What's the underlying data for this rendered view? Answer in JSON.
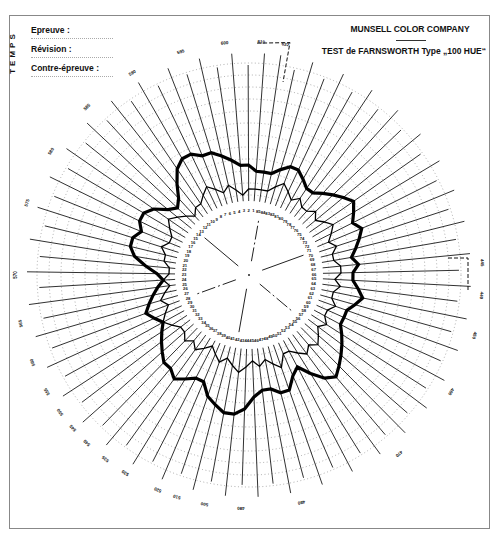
{
  "header": {
    "temps_label": "TEMPS",
    "fields": [
      {
        "label": "Epreuve :"
      },
      {
        "label": "Révision :"
      },
      {
        "label": "Contre-épreuve :"
      }
    ],
    "company": "MUNSELL COLOR COMPANY",
    "test_title": "TEST de FARNSWORTH Type „100 HUE“"
  },
  "chart_data": {
    "type": "radar",
    "title": "TEST de FARNSWORTH Type „100 HUE“",
    "subtitle": "MUNSELL COLOR COMPANY",
    "caps": 85,
    "cap_numbering": "counterclockwise from top, 1 to 85",
    "center": [
      249,
      275
    ],
    "base_radius": 68,
    "unit_px": 6,
    "ring_scores": [
      2,
      4,
      6,
      8,
      10,
      12,
      14,
      16,
      18,
      20,
      22,
      24
    ],
    "inner_ring_labels": [
      "1",
      "2",
      "3",
      "4",
      "5",
      "6",
      "7",
      "8",
      "9",
      "10",
      "11",
      "12",
      "13",
      "14",
      "15",
      "16",
      "17",
      "18",
      "19",
      "20",
      "21",
      "22",
      "23",
      "24",
      "25",
      "26",
      "27",
      "28",
      "29",
      "30",
      "31",
      "32",
      "33",
      "34",
      "35",
      "36",
      "37",
      "38",
      "39",
      "40",
      "41",
      "42",
      "43",
      "44",
      "45",
      "46",
      "47",
      "48",
      "49",
      "50",
      "51",
      "52",
      "53",
      "54",
      "55",
      "56",
      "57",
      "58",
      "59",
      "60",
      "61",
      "62",
      "63",
      "64",
      "65",
      "66",
      "67",
      "68",
      "69",
      "70",
      "71",
      "72",
      "73",
      "74",
      "75",
      "76",
      "77",
      "78",
      "79",
      "80",
      "81",
      "82",
      "83",
      "84",
      "85"
    ],
    "outer_wavelength_labels": [
      {
        "text": "610",
        "angle": 3
      },
      {
        "text": "622",
        "angle": 9
      },
      {
        "text": "600",
        "angle": -6
      },
      {
        "text": "595",
        "angle": -17
      },
      {
        "text": "590",
        "angle": -30
      },
      {
        "text": "585",
        "angle": -44
      },
      {
        "text": "580",
        "angle": -58
      },
      {
        "text": "575",
        "angle": -72
      },
      {
        "text": "570",
        "angle": -90
      },
      {
        "text": "565",
        "angle": -102
      },
      {
        "text": "560",
        "angle": -112
      },
      {
        "text": "555",
        "angle": -120
      },
      {
        "text": "550",
        "angle": -126
      },
      {
        "text": "545",
        "angle": -131
      },
      {
        "text": "540",
        "angle": -136
      },
      {
        "text": "535",
        "angle": -142
      },
      {
        "text": "530",
        "angle": -148
      },
      {
        "text": "520",
        "angle": -157
      },
      {
        "text": "510",
        "angle": -162
      },
      {
        "text": "500",
        "angle": -169
      },
      {
        "text": "490",
        "angle": -178
      },
      {
        "text": "480",
        "angle": 167
      },
      {
        "text": "470",
        "angle": 140
      },
      {
        "text": "460",
        "angle": 120
      },
      {
        "text": "450",
        "angle": 105
      },
      {
        "text": "445",
        "angle": 87
      },
      {
        "text": "440",
        "angle": 95
      }
    ],
    "series": [
      {
        "name": "thick",
        "stroke": "#000000",
        "width": 3.2,
        "scores": [
          6,
          7,
          7,
          8,
          9,
          10,
          10,
          11,
          11,
          10,
          8,
          6,
          5,
          6,
          8,
          9,
          9,
          8,
          9,
          9,
          8,
          6,
          4,
          3,
          4,
          5,
          6,
          7,
          6,
          5,
          6,
          7,
          8,
          9,
          9,
          10,
          9,
          8,
          8,
          10,
          11,
          12,
          12,
          11,
          9,
          8,
          8,
          9,
          9,
          7,
          6,
          8,
          10,
          11,
          10,
          9,
          8,
          7,
          6,
          6,
          6,
          7,
          8,
          7,
          6,
          6,
          7,
          6,
          7,
          8,
          9,
          8,
          9,
          10,
          9,
          8,
          7,
          6,
          6,
          7,
          8,
          8,
          7,
          6,
          6
        ]
      },
      {
        "name": "thin",
        "stroke": "#000000",
        "width": 1.3,
        "scores": [
          3,
          3,
          2,
          3,
          4,
          3,
          4,
          5,
          4,
          3,
          3,
          2,
          3,
          4,
          5,
          4,
          3,
          3,
          4,
          3,
          3,
          2,
          2,
          3,
          2,
          3,
          4,
          3,
          4,
          5,
          4,
          3,
          3,
          4,
          3,
          4,
          3,
          2,
          3,
          4,
          3,
          4,
          5,
          4,
          3,
          4,
          3,
          4,
          5,
          3,
          3,
          4,
          5,
          4,
          5,
          4,
          3,
          4,
          3,
          3,
          4,
          3,
          3,
          4,
          3,
          4,
          4,
          3,
          3,
          4,
          3,
          4,
          5,
          4,
          3,
          4,
          3,
          3,
          4,
          3,
          4,
          5,
          4,
          3,
          3
        ]
      }
    ]
  }
}
